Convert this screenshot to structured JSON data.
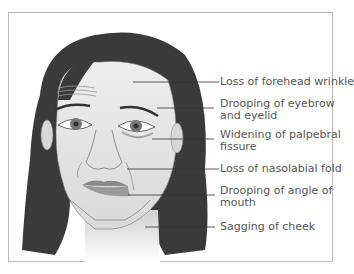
{
  "figure": {
    "labels": [
      {
        "id": "forehead",
        "text": "Loss of forehead wrinkle",
        "line2": ""
      },
      {
        "id": "eyebrow",
        "text": "Drooping of eyebrow",
        "line2": "and eyelid"
      },
      {
        "id": "palpebral",
        "text": "Widening of palpebral",
        "line2": "fissure"
      },
      {
        "id": "nasolabial",
        "text": "Loss of nasolabial fold",
        "line2": ""
      },
      {
        "id": "mouth",
        "text": "Drooping of angle of",
        "line2": "mouth"
      },
      {
        "id": "cheek",
        "text": "Sagging of cheek",
        "line2": ""
      }
    ]
  },
  "colors": {
    "hair": "#3a3a3a",
    "skin": "#e4e4e4",
    "lips": "#8a8a8a",
    "frame": "#b8b8b8",
    "text": "#555555"
  }
}
